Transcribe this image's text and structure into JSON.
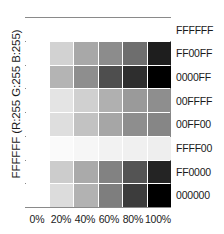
{
  "chart_data": {
    "type": "heatmap",
    "title": "",
    "xlabel": "",
    "ylabel": "FFFFFF (R:255 G:255 B:255)",
    "grid": false,
    "legend": "none",
    "categories": [
      "0%",
      "20%",
      "40%",
      "60%",
      "80%",
      "100%"
    ],
    "rows": [
      "FFFFFF",
      "FF00FF",
      "0000FF",
      "00FFFF",
      "00FF00",
      "FFFF00",
      "FF0000",
      "000000"
    ],
    "series": [
      {
        "name": "FFFFFF",
        "values": [
          "#ffffff",
          "#ffffff",
          "#ffffff",
          "#ffffff",
          "#ffffff",
          "#ffffff"
        ]
      },
      {
        "name": "FF00FF",
        "values": [
          "#ffffff",
          "#d2d2d2",
          "#a8a8a8",
          "#8c8c8c",
          "#6e6e6e",
          "#1e1e1e"
        ]
      },
      {
        "name": "0000FF",
        "values": [
          "#ffffff",
          "#b4b4b4",
          "#8e8e8e",
          "#4e4e4e",
          "#2e2e2e",
          "#000000"
        ]
      },
      {
        "name": "00FFFF",
        "values": [
          "#ffffff",
          "#e4e4e4",
          "#d0d0d0",
          "#b0b0b0",
          "#9a9a9a",
          "#8e8e8e"
        ]
      },
      {
        "name": "00FF00",
        "values": [
          "#ffffff",
          "#dedede",
          "#c2c2c2",
          "#a6a6a6",
          "#8e8e8e",
          "#868686"
        ]
      },
      {
        "name": "FFFF00",
        "values": [
          "#ffffff",
          "#fafafa",
          "#f6f6f6",
          "#f2f2f2",
          "#f0f0f0",
          "#eeeeee"
        ]
      },
      {
        "name": "FF0000",
        "values": [
          "#ffffff",
          "#cccccc",
          "#aaaaaa",
          "#828282",
          "#545454",
          "#242424"
        ]
      },
      {
        "name": "000000",
        "values": [
          "#ffffff",
          "#dcdcdc",
          "#b2b2b2",
          "#7e7e7e",
          "#3c3c3c",
          "#000000"
        ]
      }
    ],
    "axis_colors": {
      "frame": "#8a8a8a",
      "text": "#1a1a1a",
      "background": "#ffffff"
    }
  }
}
